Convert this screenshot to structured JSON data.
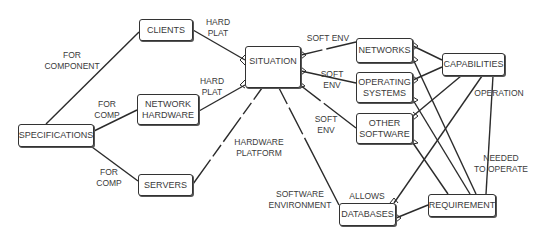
{
  "nodes": {
    "specifications": "SPECIFICATIONS",
    "clients": "CLIENTS",
    "network_hardware": "NETWORK\nHARDWARE",
    "servers": "SERVERS",
    "situation": "SITUATION",
    "networks": "NETWORKS",
    "operating_systems": "OPERATING\nSYSTEMS",
    "other_software": "OTHER\nSOFTWARE",
    "databases": "DATABASES",
    "capabilities": "CAPABILITIES",
    "requirement": "REQUIREMENT"
  },
  "edge_labels": {
    "spec_clients": "FOR\nCOMPONENT",
    "spec_nethw": "FOR\nCOMP",
    "spec_servers": "FOR\nCOMP",
    "clients_situation": "HARD\nPLAT",
    "nethw_situation": "HARD\nPLAT",
    "servers_situation": "HARDWARE\nPLATFORM",
    "situation_networks": "SOFT ENV",
    "situation_os": "SOFT\nENV",
    "situation_other": "SOFT\nENV",
    "situation_databases": "SOFTWARE\nENVIRONMENT",
    "databases_capabilities": "ALLOWS",
    "capabilities_requirement": "OPERATION",
    "requirement_needed": "NEEDED\nTO OPERATE"
  },
  "colors": {
    "line": "#2b2b2b",
    "text": "#3a3a3a",
    "background": "#ffffff"
  }
}
